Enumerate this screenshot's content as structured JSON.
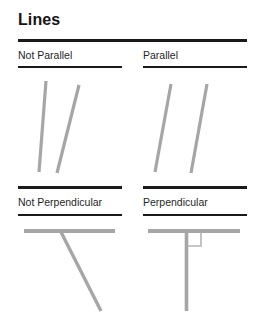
{
  "page": {
    "title": "Lines",
    "background_color": "#ffffff",
    "rule_color": "#1a1a1a",
    "line_color": "#a6a6a6"
  },
  "sections": [
    {
      "id": "not-parallel",
      "label": "Not Parallel",
      "column": "left",
      "row": "top",
      "figure": {
        "type": "two-lines-converging",
        "segments": [
          {
            "name": "line-a",
            "x1": 46,
            "y1": 81,
            "x2": 39,
            "y2": 172
          },
          {
            "name": "line-b",
            "x1": 79,
            "y1": 85,
            "x2": 57,
            "y2": 173
          }
        ]
      }
    },
    {
      "id": "parallel",
      "label": "Parallel",
      "column": "right",
      "row": "top",
      "figure": {
        "type": "two-lines-parallel",
        "segments": [
          {
            "name": "line-a",
            "x1": 171,
            "y1": 84,
            "x2": 155,
            "y2": 172
          },
          {
            "name": "line-b",
            "x1": 207,
            "y1": 84,
            "x2": 191,
            "y2": 173
          }
        ]
      }
    },
    {
      "id": "not-perpendicular",
      "label": "Not Perpendicular",
      "column": "left",
      "row": "bottom",
      "figure": {
        "type": "oblique-intersection",
        "segments": [
          {
            "name": "horizontal-line",
            "x1": 24,
            "y1": 231,
            "x2": 115,
            "y2": 231
          },
          {
            "name": "oblique-line",
            "x1": 61,
            "y1": 232,
            "x2": 101,
            "y2": 311
          }
        ],
        "right_angle_marker": false
      }
    },
    {
      "id": "perpendicular",
      "label": "Perpendicular",
      "column": "right",
      "row": "bottom",
      "figure": {
        "type": "right-angle-intersection",
        "segments": [
          {
            "name": "horizontal-line",
            "x1": 148,
            "y1": 231,
            "x2": 240,
            "y2": 231
          },
          {
            "name": "vertical-line",
            "x1": 186,
            "y1": 232,
            "x2": 186,
            "y2": 311
          }
        ],
        "right_angle_marker": true,
        "right_angle_marker_box": {
          "x": 188,
          "y": 233,
          "size": 13
        }
      }
    }
  ],
  "rules": {
    "main": {
      "x": 18,
      "y": 39,
      "width": 229,
      "thickness": 3
    },
    "top_left_under_label": {
      "x": 18,
      "y": 66,
      "width": 104,
      "thickness": 2
    },
    "top_right_under_label": {
      "x": 143,
      "y": 66,
      "width": 104,
      "thickness": 2
    },
    "bottom_left_over_label": {
      "x": 18,
      "y": 186,
      "width": 104,
      "thickness": 3
    },
    "bottom_right_over_label": {
      "x": 143,
      "y": 186,
      "width": 104,
      "thickness": 3
    },
    "bottom_left_under_label": {
      "x": 18,
      "y": 214,
      "width": 104,
      "thickness": 2
    },
    "bottom_right_under_label": {
      "x": 143,
      "y": 214,
      "width": 104,
      "thickness": 2
    }
  },
  "labels": {
    "top_left_pos": {
      "x": 18,
      "y": 49
    },
    "top_right_pos": {
      "x": 143,
      "y": 49
    },
    "bottom_left_pos": {
      "x": 18,
      "y": 196
    },
    "bottom_right_pos": {
      "x": 143,
      "y": 196
    }
  }
}
